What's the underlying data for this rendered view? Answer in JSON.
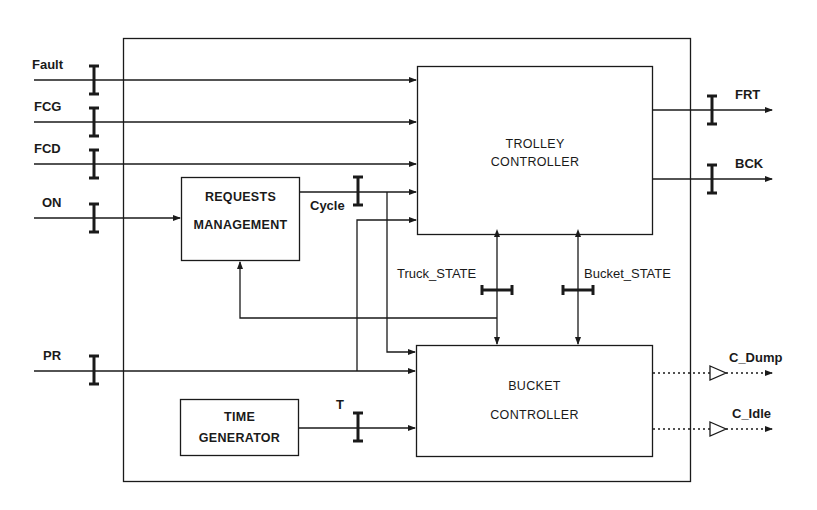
{
  "colors": {
    "line": "#1a1a1a",
    "background": "#ffffff"
  },
  "system_boundary": {
    "name": "control-system"
  },
  "blocks": {
    "trolley": {
      "line1": "TROLLEY",
      "line2": "CONTROLLER"
    },
    "requests": {
      "line1": "REQUESTS",
      "line2": "MANAGEMENT"
    },
    "bucket": {
      "line1": "BUCKET",
      "line2": "CONTROLLER"
    },
    "time": {
      "line1": "TIME",
      "line2": "GENERATOR"
    }
  },
  "inputs": [
    {
      "label": "Fault"
    },
    {
      "label": "FCG"
    },
    {
      "label": "FCD"
    },
    {
      "label": "ON"
    },
    {
      "label": "PR"
    }
  ],
  "outputs": [
    {
      "label": "FRT",
      "style": "solid"
    },
    {
      "label": "BCK",
      "style": "solid"
    },
    {
      "label": "C_Dump",
      "style": "dotted"
    },
    {
      "label": "C_Idle",
      "style": "dotted"
    }
  ],
  "internal_signals": {
    "cycle": "Cycle",
    "truck_state": "Truck_STATE",
    "bucket_state": "Bucket_STATE",
    "t": "T"
  }
}
